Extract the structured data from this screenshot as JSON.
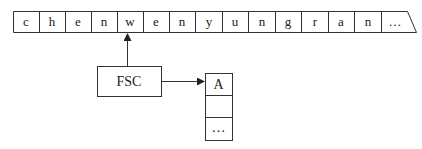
{
  "strip": {
    "cells": [
      "c",
      "h",
      "e",
      "n",
      "w",
      "e",
      "n",
      "y",
      "u",
      "n",
      "g",
      "r",
      "a",
      "n",
      "…"
    ]
  },
  "pointer_box": {
    "label": "FSC"
  },
  "stack": {
    "cells": [
      "A",
      "",
      "…"
    ]
  }
}
